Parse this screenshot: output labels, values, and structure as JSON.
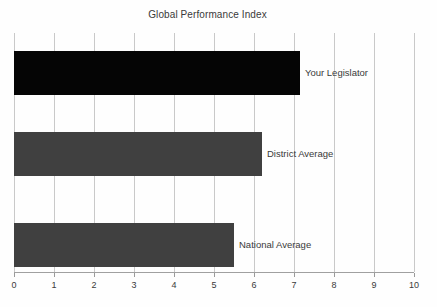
{
  "chart_data": {
    "type": "bar",
    "orientation": "horizontal",
    "title": "Global Performance Index",
    "xlabel": "",
    "ylabel": "",
    "categories": [
      "Your Legislator",
      "District Average",
      "National Average"
    ],
    "values": [
      7.15,
      6.2,
      5.5
    ],
    "series": [
      {
        "name": "Global Performance Index",
        "values": [
          7.15,
          6.2,
          5.5
        ]
      }
    ],
    "bars": [
      {
        "label": "Your Legislator",
        "value": 7.15,
        "color": "#050505"
      },
      {
        "label": "District Average",
        "value": 6.2,
        "color": "#404040"
      },
      {
        "label": "National Average",
        "value": 5.5,
        "color": "#404040"
      }
    ],
    "xlim": [
      0,
      10
    ],
    "xticks": [
      0,
      1,
      2,
      3,
      4,
      5,
      6,
      7,
      8,
      9,
      10
    ],
    "xtick_labels": [
      "0",
      "1",
      "2",
      "3",
      "4",
      "5",
      "6",
      "7",
      "8",
      "9",
      "10"
    ],
    "grid": true,
    "grid_axis": "x",
    "legend": false,
    "legend_position": "none",
    "bar_label_position": "right-of-bar",
    "colors": {
      "background": "#fefefe",
      "highlight_bar": "#050505",
      "reference_bar": "#404040",
      "gridline": "#c9c9c9",
      "axis": "#a0a0a0",
      "text": "#3a3a3a"
    }
  }
}
